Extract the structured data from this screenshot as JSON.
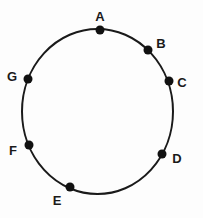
{
  "diagram": {
    "shape": "ellipse",
    "ellipse": {
      "cx": 97.5,
      "cy": 111.5,
      "rx": 75.5,
      "ry": 82.5,
      "stroke": "#1a1a1a",
      "stroke_width": 2
    },
    "point_color": "#111111",
    "points": [
      {
        "label": "A",
        "x": 100,
        "y": 30,
        "lx": 100,
        "ly": 21
      },
      {
        "label": "B",
        "x": 148,
        "y": 50,
        "lx": 161,
        "ly": 48
      },
      {
        "label": "C",
        "x": 169,
        "y": 81,
        "lx": 182,
        "ly": 87
      },
      {
        "label": "D",
        "x": 162,
        "y": 154,
        "lx": 177,
        "ly": 163
      },
      {
        "label": "E",
        "x": 70,
        "y": 187,
        "lx": 57,
        "ly": 205
      },
      {
        "label": "F",
        "x": 29,
        "y": 145,
        "lx": 13,
        "ly": 155
      },
      {
        "label": "G",
        "x": 28,
        "y": 79,
        "lx": 12,
        "ly": 81
      }
    ]
  }
}
